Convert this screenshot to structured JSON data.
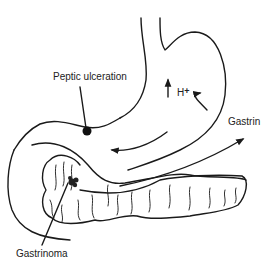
{
  "diagram": {
    "labels": {
      "peptic_ulceration": "Peptic ulceration",
      "h_plus_base": "H",
      "h_plus_sup": "+",
      "gastrin": "Gastrin",
      "gastrinoma": "Gastrinoma"
    },
    "structures": [
      "stomach",
      "duodenum",
      "pancreas",
      "gastrinoma",
      "ulcer"
    ],
    "colors": {
      "line": "#1a1a1a",
      "background": "#ffffff"
    }
  }
}
